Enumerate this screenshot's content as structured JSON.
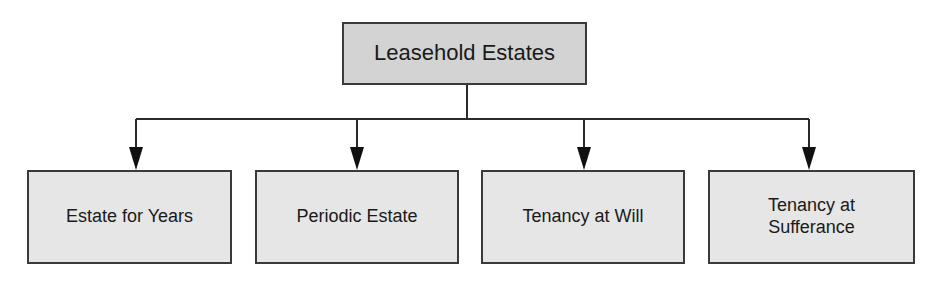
{
  "diagram": {
    "type": "tree",
    "root": {
      "label": "Leasehold Estates"
    },
    "children": [
      {
        "label": "Estate for Years"
      },
      {
        "label": "Periodic Estate"
      },
      {
        "label": "Tenancy at Will"
      },
      {
        "label_lines": [
          "Tenancy at",
          "Sufferance"
        ],
        "label": "Tenancy at Sufferance"
      }
    ],
    "edges": [
      {
        "from": "Leasehold Estates",
        "to": "Estate for Years"
      },
      {
        "from": "Leasehold Estates",
        "to": "Periodic Estate"
      },
      {
        "from": "Leasehold Estates",
        "to": "Tenancy at Will"
      },
      {
        "from": "Leasehold Estates",
        "to": "Tenancy at Sufferance"
      }
    ],
    "colors": {
      "root_fill": "#d3d3d3",
      "child_fill": "#e6e6e6",
      "stroke": "#3a3a3a"
    }
  }
}
